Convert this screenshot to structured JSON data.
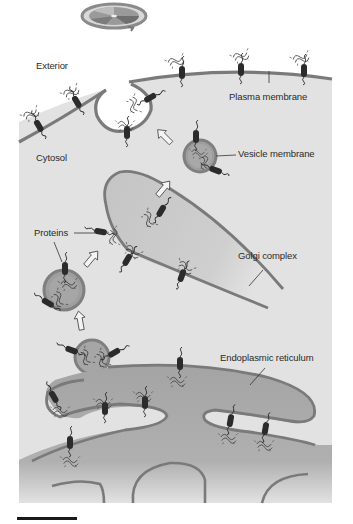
{
  "diagram": {
    "labels": {
      "exterior": "Exterior",
      "cytosol": "Cytosol",
      "plasma_membrane": "Plasma membrane",
      "vesicle_membrane": "Vesicle membrane",
      "proteins": "Proteins",
      "golgi_complex": "Golgi complex",
      "endoplasmic_reticulum": "Endoplasmic reticulum"
    },
    "icons": [
      "rotating-disc-icon",
      "flow-arrow-icon",
      "protein-icon",
      "scale-bar"
    ],
    "colors": {
      "cytosol": "#e2e2e2",
      "membrane": "#7a7a7a",
      "golgi_fill": "#c8c8c8",
      "er_fill": "#a8a8a8",
      "vesicle_fill": "#9e9e9e",
      "protein": "#2b2b2b",
      "background": "#ffffff"
    },
    "flow": [
      "Endoplasmic reticulum",
      "Vesicle",
      "Golgi complex",
      "Vesicle",
      "Plasma membrane",
      "Exterior"
    ]
  }
}
